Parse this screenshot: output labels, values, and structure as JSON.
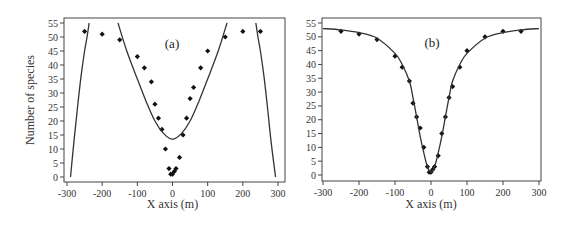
{
  "chart_data": [
    {
      "type": "scatter",
      "panel_label": "(a)",
      "title": "",
      "xlabel": "X axis (m)",
      "ylabel": "Number of species",
      "xlim": [
        -300,
        300
      ],
      "ylim": [
        0,
        55
      ],
      "xticks": [
        -300,
        -200,
        -100,
        0,
        100,
        200,
        300
      ],
      "yticks": [
        0,
        5,
        10,
        15,
        20,
        25,
        30,
        35,
        40,
        45,
        50,
        55
      ],
      "grid": false,
      "series": [
        {
          "name": "observed",
          "marker": "diamond",
          "x": [
            -250,
            -200,
            -150,
            -100,
            -80,
            -60,
            -50,
            -40,
            -30,
            -20,
            -10,
            -5,
            0,
            5,
            10,
            20,
            30,
            40,
            50,
            60,
            80,
            100,
            150,
            200,
            250
          ],
          "y": [
            52,
            51,
            49,
            43,
            39,
            34,
            26,
            21,
            17,
            10,
            3,
            1,
            1,
            2,
            3,
            7,
            15,
            21,
            28,
            32,
            39,
            45,
            50,
            52,
            52
          ]
        },
        {
          "name": "fitted curve (polynomial)",
          "line": true,
          "segments": [
            {
              "x": [
                -290,
                -280,
                -270,
                -260,
                -250,
                -243,
                -237
              ],
              "y": [
                0,
                13,
                25,
                36,
                45,
                50,
                55
              ]
            },
            {
              "x": [
                -155,
                -130,
                -100,
                -75,
                -50,
                -25,
                0,
                25,
                50,
                75,
                100,
                130,
                155
              ],
              "y": [
                55,
                45,
                35,
                27,
                20,
                15.5,
                13.5,
                15.5,
                20,
                27,
                35,
                45,
                55
              ]
            },
            {
              "x": [
                237,
                243,
                250,
                260,
                270,
                280,
                293
              ],
              "y": [
                55,
                50,
                45,
                36,
                25,
                13,
                0
              ]
            }
          ]
        }
      ]
    },
    {
      "type": "scatter",
      "panel_label": "(b)",
      "title": "",
      "xlabel": "X axis (m)",
      "ylabel": "",
      "xlim": [
        -300,
        300
      ],
      "ylim": [
        0,
        55
      ],
      "xticks": [
        -300,
        -200,
        -100,
        0,
        100,
        200,
        300
      ],
      "yticks": [
        0,
        5,
        10,
        15,
        20,
        25,
        30,
        35,
        40,
        45,
        50,
        55
      ],
      "grid": false,
      "series": [
        {
          "name": "observed",
          "marker": "diamond",
          "x": [
            -250,
            -200,
            -150,
            -100,
            -80,
            -60,
            -50,
            -40,
            -30,
            -20,
            -10,
            -5,
            0,
            5,
            10,
            20,
            30,
            40,
            50,
            60,
            80,
            100,
            150,
            200,
            250
          ],
          "y": [
            52,
            51,
            49,
            43,
            39,
            34,
            26,
            21,
            17,
            10,
            3,
            1,
            1,
            2,
            3,
            7,
            15,
            21,
            28,
            32,
            39,
            45,
            50,
            52,
            52
          ]
        },
        {
          "name": "fitted curve (sigmoidal)",
          "line": true,
          "x": [
            -300,
            -250,
            -200,
            -150,
            -100,
            -80,
            -60,
            -50,
            -40,
            -30,
            -20,
            -10,
            0,
            10,
            20,
            30,
            40,
            50,
            60,
            80,
            100,
            150,
            200,
            250,
            300
          ],
          "y": [
            53,
            52.5,
            51.5,
            49.5,
            44,
            40,
            34,
            28,
            21,
            14,
            8,
            3,
            1,
            3,
            8,
            14,
            21,
            28,
            34,
            40,
            44,
            49.5,
            51.5,
            52.5,
            53
          ]
        }
      ]
    }
  ]
}
